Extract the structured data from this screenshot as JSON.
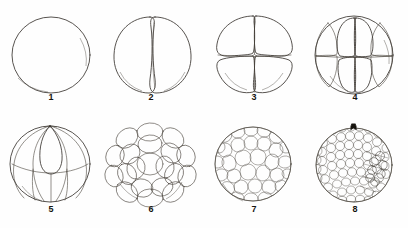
{
  "plate": {
    "title": "Cleavage stages plate",
    "background_color": "#ffffff",
    "ink_color": "#3a3530",
    "label_color": "#15130f",
    "columns": 4,
    "rows": 2
  },
  "stages": [
    {
      "label": "1",
      "name": "zygote-single-cell",
      "cell_count": "1",
      "description": "Single spherical uncleaved egg",
      "annotation": ""
    },
    {
      "label": "2",
      "name": "two-cell-stage",
      "cell_count": "2",
      "description": "Two blastomeres after first meridional cleavage",
      "annotation": ""
    },
    {
      "label": "3",
      "name": "four-cell-stage",
      "cell_count": "4",
      "description": "Four blastomeres after second meridional cleavage",
      "annotation": ""
    },
    {
      "label": "4",
      "name": "eight-cell-stage",
      "cell_count": "8",
      "description": "Eight blastomeres after third cleavage",
      "annotation": ""
    },
    {
      "label": "5",
      "name": "sixteen-cell-stage",
      "cell_count": "16",
      "description": "Sixteen blastomeres, meridional and latitudinal furrows",
      "annotation": ""
    },
    {
      "label": "6",
      "name": "morula-stage",
      "cell_count": "32",
      "description": "Morula of rounded blastomeres",
      "annotation": ""
    },
    {
      "label": "7",
      "name": "early-blastula-stage",
      "cell_count": "64",
      "description": "Early blastula with many small cells",
      "annotation": ""
    },
    {
      "label": "8",
      "name": "late-blastula-stage",
      "cell_count": "128",
      "description": "Late blastula, numerous minute cells, marker at animal pole",
      "annotation": "animal-pole-marker"
    }
  ]
}
